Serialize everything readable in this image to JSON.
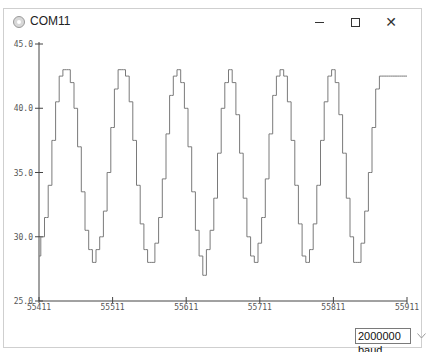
{
  "window": {
    "title": "COM11",
    "icon": "serial-plotter-icon",
    "controls": {
      "minimize": "minimize-icon",
      "maximize": "maximize-icon",
      "close": "close-icon",
      "close_glyph": "✕"
    }
  },
  "plot": {
    "y_tick_labels": [
      "45.0",
      "40.0",
      "35.0",
      "30.0",
      "25.0"
    ],
    "x_tick_labels": [
      "55411",
      "55511",
      "55611",
      "55711",
      "55811",
      "55911"
    ],
    "line_color": "#7a7a7a",
    "axis_color": "#444444"
  },
  "footer": {
    "baud_rate": "2000000 baud",
    "dropdown_icon": "chevron-down-icon"
  },
  "chart_data": {
    "type": "line",
    "title": "",
    "xlabel": "",
    "ylabel": "",
    "ylim": [
      25.0,
      45.0
    ],
    "xlim": [
      55411,
      55911
    ],
    "y_ticks": [
      25.0,
      30.0,
      35.0,
      40.0,
      45.0
    ],
    "x_ticks": [
      55411,
      55511,
      55611,
      55711,
      55811,
      55911
    ],
    "grid": false,
    "legend": "none",
    "series": [
      {
        "name": "value",
        "description": "Stepped quasi-sinusoidal signal oscillating between ~28 and ~43 with period ~77 samples",
        "x": [
          55411,
          55416,
          55421,
          55426,
          55431,
          55436,
          55441,
          55446,
          55451,
          55456,
          55461,
          55466,
          55471,
          55476,
          55481,
          55486,
          55491,
          55496,
          55501,
          55506,
          55511,
          55516,
          55521,
          55526,
          55531,
          55536,
          55541,
          55546,
          55551,
          55556,
          55561,
          55566,
          55571,
          55576,
          55581,
          55586,
          55591,
          55596,
          55601,
          55606,
          55611,
          55616,
          55621,
          55626,
          55631,
          55636,
          55641,
          55646,
          55651,
          55656,
          55661,
          55666,
          55671,
          55676,
          55681,
          55686,
          55691,
          55696,
          55701,
          55706,
          55711,
          55716,
          55721,
          55726,
          55731,
          55736,
          55741,
          55746,
          55751,
          55756,
          55761,
          55766,
          55771,
          55776,
          55781,
          55786,
          55791,
          55796,
          55801,
          55806,
          55811,
          55816,
          55821,
          55826,
          55831,
          55836,
          55841,
          55846,
          55851,
          55856,
          55861,
          55866,
          55871,
          55876,
          55881,
          55886,
          55891,
          55896,
          55901,
          55906,
          55911
        ],
        "values": [
          28.5,
          30.0,
          31.5,
          34.0,
          37.5,
          40.5,
          42.5,
          43.0,
          43.0,
          42.0,
          40.0,
          37.0,
          33.5,
          30.5,
          29.0,
          28.0,
          29.0,
          30.0,
          32.0,
          35.0,
          38.5,
          41.5,
          43.0,
          43.0,
          42.5,
          40.5,
          37.5,
          34.0,
          31.0,
          29.0,
          28.0,
          28.0,
          29.5,
          31.5,
          34.5,
          38.0,
          41.0,
          42.5,
          43.0,
          42.0,
          40.0,
          37.0,
          33.5,
          30.5,
          28.5,
          27.0,
          29.0,
          30.5,
          33.0,
          36.5,
          40.0,
          42.0,
          43.0,
          42.0,
          39.5,
          36.5,
          33.0,
          30.0,
          28.5,
          28.0,
          29.5,
          31.5,
          34.5,
          38.0,
          41.0,
          42.5,
          43.0,
          42.5,
          40.5,
          37.5,
          34.0,
          31.0,
          28.5,
          28.0,
          29.0,
          31.0,
          34.0,
          37.5,
          40.5,
          42.5,
          43.0,
          42.0,
          39.5,
          36.5,
          33.0,
          30.0,
          28.0,
          28.0,
          29.5,
          32.0,
          35.0,
          38.5,
          41.5,
          42.5,
          42.5,
          42.5,
          42.5,
          42.5,
          42.5,
          42.5,
          42.5
        ]
      }
    ]
  }
}
